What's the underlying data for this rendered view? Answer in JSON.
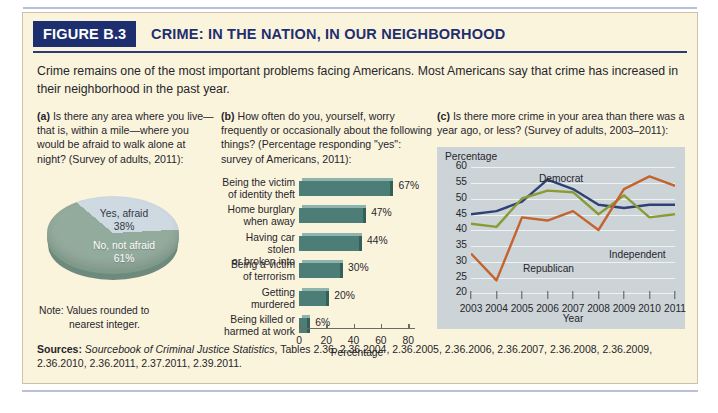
{
  "ghost_text": {
    "badge": "FIGURE B.4",
    "title": "WHO ARE THE"
  },
  "header": {
    "badge": "FIGURE B.3",
    "title": "CRIME: IN THE NATION, IN OUR NEIGHBORHOOD"
  },
  "intro": "Crime remains one of the most important problems facing Americans. Most Americans say that crime has increased in their neighborhood in the past year.",
  "panel_a": {
    "label": "(a)",
    "question": "Is there any area where you live—that is, within a mile—where you would be afraid to walk alone at night? (Survey of adults, 2011):",
    "note_label": "Note: Values rounded to",
    "note_cont": "nearest integer.",
    "chart_data": {
      "type": "pie",
      "title": "Is there any area where you live—that is, within a mile—where you would be afraid to walk alone at night?",
      "labels": [
        "Yes, afraid",
        "No, not afraid"
      ],
      "values": [
        38,
        61
      ],
      "value_labels": [
        "38%",
        "61%"
      ],
      "colors": [
        "#cfd9e2",
        "#93ab9c"
      ],
      "units": "percent",
      "legend": "inside-slices"
    }
  },
  "panel_b": {
    "label": "(b)",
    "question": "How often do you, yourself, worry frequently or occasionally about the following things? (Percentage responding \"yes\": survey of Americans, 2011):",
    "chart_data": {
      "type": "bar",
      "orientation": "horizontal",
      "title": "How often do you, yourself, worry frequently or occasionally about the following things?",
      "categories": [
        "Being the victim of identity theft",
        "Home burglary when away",
        "Having car stolen or broken into",
        "Being a victim of terrorism",
        "Getting murdered",
        "Being killed or harmed at work"
      ],
      "category_lines": [
        [
          "Being the victim",
          "of identity theft"
        ],
        [
          "Home burglary",
          "when away"
        ],
        [
          "Having car stolen",
          "or broken into"
        ],
        [
          "Being a victim",
          "of terrorism"
        ],
        [
          "Getting",
          "murdered"
        ],
        [
          "Being killed or",
          "harmed at work"
        ]
      ],
      "values": [
        67,
        47,
        44,
        30,
        20,
        6
      ],
      "value_labels": [
        "67%",
        "47%",
        "44%",
        "30%",
        "20%",
        "6%"
      ],
      "xlabel": "Percentage",
      "ylabel": "",
      "xlim": [
        0,
        85
      ],
      "xticks": [
        0,
        20,
        40,
        60,
        80
      ],
      "bar_color": "#4c7d76",
      "grid": false
    }
  },
  "panel_c": {
    "label": "(c)",
    "question": "Is there more crime in your area than there was a year ago, or less? (Survey of adults, 2003–2011):",
    "chart_data": {
      "type": "line",
      "title": "Is there more crime in your area than there was a year ago, or less?",
      "ylabel": "Percentage",
      "xlabel": "Year",
      "x": [
        2003,
        2004,
        2005,
        2006,
        2007,
        2008,
        2009,
        2010,
        2011
      ],
      "xticks": [
        "2003",
        "2004",
        "2005",
        "2006",
        "2007",
        "2008",
        "2009",
        "2010",
        "2011"
      ],
      "ylim": [
        20,
        60
      ],
      "yticks": [
        20,
        25,
        30,
        35,
        40,
        45,
        50,
        55,
        60
      ],
      "grid": true,
      "legend": "inline-annotations",
      "series": [
        {
          "name": "Democrat",
          "color": "#2d4274",
          "values": [
            45,
            46,
            49,
            56,
            53,
            48,
            47,
            48,
            48
          ]
        },
        {
          "name": "Independent",
          "color": "#8a9b36",
          "values": [
            42,
            41,
            50,
            52.5,
            52,
            45,
            51,
            44,
            45
          ]
        },
        {
          "name": "Republican",
          "color": "#c4632c",
          "values": [
            32.5,
            24,
            44,
            43,
            46,
            40,
            53,
            57,
            54
          ]
        }
      ],
      "plot_bg": "#ccd4d8"
    }
  },
  "sources": {
    "label": "Sources:",
    "italic": "Sourcebook of Criminal Justice Statistics",
    "rest": ", Tables 2.36, 2.36.2004, 2.36.2005, 2.36.2006, 2.36.2007, 2.36.2008, 2.36.2009, 2.36.2010, 2.36.2011, 2.37.2011, 2.39.2011."
  }
}
